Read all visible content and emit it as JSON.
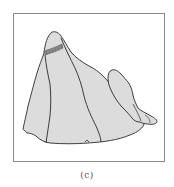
{
  "figure": {
    "caption": "(c)",
    "colors": {
      "fill": "#dcdcdc",
      "outline": "#2a2a2a",
      "frame": "#8a8a8a",
      "band_hatching": "#555555"
    }
  }
}
